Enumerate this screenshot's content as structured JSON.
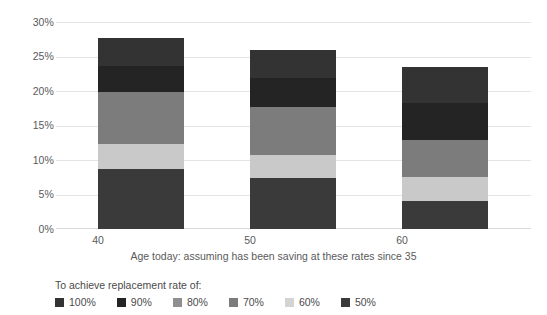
{
  "chart_data": {
    "type": "bar",
    "stacked": true,
    "title": "",
    "subtitle": "",
    "xlabel": "Age today: assuming has been saving at these rates since 35",
    "ylabel": "",
    "categories": [
      "40",
      "50",
      "60"
    ],
    "ylim": [
      0,
      30
    ],
    "yticks": [
      "0%",
      "5%",
      "10%",
      "15%",
      "20%",
      "25%",
      "30%"
    ],
    "ytick_values": [
      0,
      5,
      10,
      15,
      20,
      25,
      30
    ],
    "grid": true,
    "legend_position": "bottom",
    "legend_title": "To achieve replacement rate of:",
    "series": [
      {
        "name": "50%",
        "values": [
          8.7,
          7.4,
          4.1
        ],
        "color": "#3a3a3a"
      },
      {
        "name": "60%",
        "values": [
          3.6,
          3.3,
          3.4
        ],
        "color": "#c9c9c9"
      },
      {
        "name": "70%",
        "values": [
          7.5,
          7.0,
          5.4
        ],
        "color": "#7c7c7c"
      },
      {
        "name": "80%",
        "values": [
          0.0,
          0.0,
          0.0
        ],
        "color": "#a3a3a3"
      },
      {
        "name": "90%",
        "values": [
          3.8,
          4.2,
          5.4
        ],
        "color": "#242424"
      },
      {
        "name": "100%",
        "values": [
          4.1,
          4.1,
          5.2
        ],
        "color": "#333333"
      }
    ],
    "totals": [
      27.7,
      26.0,
      23.5
    ],
    "annotations": []
  },
  "legend": {
    "title": "To achieve replacement rate of:",
    "items": [
      {
        "label": "100%",
        "color": "#333333"
      },
      {
        "label": "90%",
        "color": "#242424"
      },
      {
        "label": "80%",
        "color": "#8f8f8f"
      },
      {
        "label": "70%",
        "color": "#7c7c7c"
      },
      {
        "label": "60%",
        "color": "#d4d4d4"
      },
      {
        "label": "50%",
        "color": "#3a3a3a"
      }
    ]
  },
  "axis": {
    "x_title": "Age today: assuming has been saving at these rates since 35",
    "categories": [
      "40",
      "50",
      "60"
    ],
    "y_ticks": [
      "30%",
      "25%",
      "20%",
      "15%",
      "10%",
      "5%",
      "0%"
    ]
  },
  "colors": {
    "grid": "#e4e4e4",
    "text": "#4a4a4a",
    "background": "#ffffff"
  }
}
